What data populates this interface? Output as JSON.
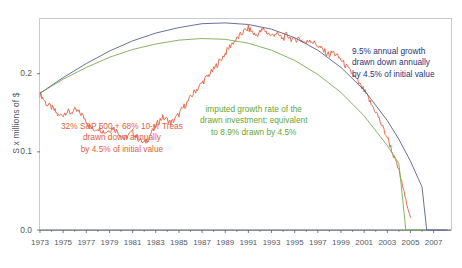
{
  "chart_data": {
    "type": "line",
    "title": "",
    "xlabel": "",
    "ylabel": "S x millions of $",
    "xlim": [
      1973,
      2008.5
    ],
    "ylim": [
      0.0,
      0.27
    ],
    "grid": false,
    "legend_position": "none",
    "yticks": [
      "0.0",
      "0.1",
      "0.2"
    ],
    "ytick_values": [
      0.0,
      0.1,
      0.2
    ],
    "xticks": [
      "1973",
      "1975",
      "1977",
      "1979",
      "1981",
      "1983",
      "1985",
      "1987",
      "1989",
      "1991",
      "1993",
      "1995",
      "1997",
      "1999",
      "2001",
      "2003",
      "2005",
      "2007"
    ],
    "xtick_values": [
      1973,
      1975,
      1977,
      1979,
      1981,
      1983,
      1985,
      1987,
      1989,
      1991,
      1993,
      1995,
      1997,
      1999,
      2001,
      2003,
      2005,
      2007
    ],
    "colors": {
      "actual_portfolio": "#e1603f",
      "nominal_growth": "#5a5f93",
      "imputed_growth": "#7aab55",
      "annotation_red": "#e1603f",
      "annotation_green": "#5fa83c",
      "annotation_blue": "#2b3580",
      "axis_text": "#555a66",
      "frame": "#c9c9cf"
    },
    "series": [
      {
        "name": "32% S&P 500 + 68% 10-yr Treas drawn down annually by 4.5% of initial value",
        "color": "#e1603f",
        "x": [
          1973,
          1973.3,
          1973.6,
          1974,
          1974.3,
          1974.6,
          1975,
          1975.3,
          1975.6,
          1976,
          1976.3,
          1976.6,
          1977,
          1977.3,
          1977.6,
          1978,
          1978.3,
          1978.6,
          1979,
          1979.3,
          1979.6,
          1980,
          1980.3,
          1980.6,
          1981,
          1981.3,
          1981.6,
          1982,
          1982.3,
          1982.6,
          1983,
          1983.3,
          1983.6,
          1984,
          1984.3,
          1984.6,
          1985,
          1985.3,
          1985.6,
          1986,
          1986.3,
          1986.6,
          1987,
          1987.3,
          1987.6,
          1988,
          1988.3,
          1988.6,
          1989,
          1989.3,
          1989.6,
          1990,
          1990.3,
          1990.6,
          1991,
          1991.3,
          1991.6,
          1992,
          1992.3,
          1992.6,
          1993,
          1993.3,
          1993.6,
          1994,
          1994.3,
          1994.6,
          1995,
          1995.3,
          1995.6,
          1996,
          1996.3,
          1996.6,
          1997,
          1997.3,
          1997.6,
          1998,
          1998.3,
          1998.6,
          1999,
          1999.3,
          1999.6,
          2000,
          2000.3,
          2000.6,
          2001,
          2001.3,
          2001.6,
          2002,
          2002.3,
          2002.6,
          2003,
          2003.3,
          2003.6,
          2004,
          2004.3,
          2004.6,
          2005
        ],
        "y": [
          0.175,
          0.168,
          0.16,
          0.157,
          0.152,
          0.146,
          0.148,
          0.152,
          0.15,
          0.153,
          0.151,
          0.148,
          0.14,
          0.133,
          0.128,
          0.131,
          0.128,
          0.125,
          0.128,
          0.131,
          0.127,
          0.122,
          0.116,
          0.121,
          0.125,
          0.12,
          0.115,
          0.111,
          0.116,
          0.124,
          0.133,
          0.14,
          0.144,
          0.141,
          0.137,
          0.141,
          0.148,
          0.155,
          0.161,
          0.169,
          0.176,
          0.181,
          0.188,
          0.194,
          0.199,
          0.205,
          0.212,
          0.218,
          0.226,
          0.233,
          0.239,
          0.244,
          0.249,
          0.254,
          0.258,
          0.254,
          0.249,
          0.253,
          0.257,
          0.253,
          0.248,
          0.252,
          0.249,
          0.245,
          0.25,
          0.246,
          0.242,
          0.246,
          0.243,
          0.239,
          0.244,
          0.24,
          0.236,
          0.232,
          0.228,
          0.224,
          0.228,
          0.223,
          0.218,
          0.212,
          0.206,
          0.2,
          0.193,
          0.186,
          0.178,
          0.17,
          0.161,
          0.152,
          0.142,
          0.131,
          0.119,
          0.106,
          0.092,
          0.076,
          0.058,
          0.038,
          0.016
        ],
        "note": "volatile actual-market series, starts 0.175 at 1973, dips to ~0.11 in 1981-82, peaks ~0.26 around 1991, declines to 0 by 2005"
      },
      {
        "name": "9.5% annual growth drawn down annually by 4.5% of initial value",
        "color": "#5a5f93",
        "x": [
          1973,
          1975,
          1977,
          1979,
          1981,
          1983,
          1985,
          1987,
          1989,
          1991,
          1993,
          1995,
          1997,
          1999,
          2001,
          2003,
          2004,
          2005,
          2006,
          2006.4
        ],
        "y": [
          0.175,
          0.195,
          0.213,
          0.229,
          0.242,
          0.252,
          0.259,
          0.264,
          0.265,
          0.263,
          0.257,
          0.246,
          0.23,
          0.208,
          0.179,
          0.14,
          0.116,
          0.088,
          0.055,
          0.0
        ],
        "note": "smooth arched nominal-growth curve peaking ~0.265 near 1989, falling to zero ~2006"
      },
      {
        "name": "imputed growth rate of the drawn investment: equivalent to 8.9% drawn by 4.5%",
        "color": "#7aab55",
        "x": [
          1973,
          1975,
          1977,
          1979,
          1981,
          1983,
          1985,
          1987,
          1989,
          1991,
          1993,
          1995,
          1997,
          1999,
          2001,
          2003,
          2004,
          2004.6
        ],
        "y": [
          0.175,
          0.193,
          0.208,
          0.221,
          0.231,
          0.238,
          0.243,
          0.245,
          0.244,
          0.239,
          0.23,
          0.217,
          0.199,
          0.176,
          0.146,
          0.108,
          0.085,
          0.0
        ],
        "note": "smooth arched imputed-growth curve peaking ~0.245 near 1987, falling to zero ~2004.6"
      }
    ],
    "annotations": [
      {
        "id": "annot-red",
        "color": "#e1603f",
        "lines": [
          "32% S&P 500 + 68% 10-yr Treas",
          "drawn down annually",
          "by 4.5% of initial value"
        ]
      },
      {
        "id": "annot-green",
        "color": "#5fa83c",
        "lines": [
          "imputed growth rate of the",
          "drawn investment: equivalent",
          "to 8.9% drawn by 4.5%"
        ]
      },
      {
        "id": "annot-blue",
        "color": "#2b3580",
        "lines": [
          "9.5% annual growth",
          "drawn down annually",
          "by 4.5% of initial value"
        ]
      }
    ]
  }
}
